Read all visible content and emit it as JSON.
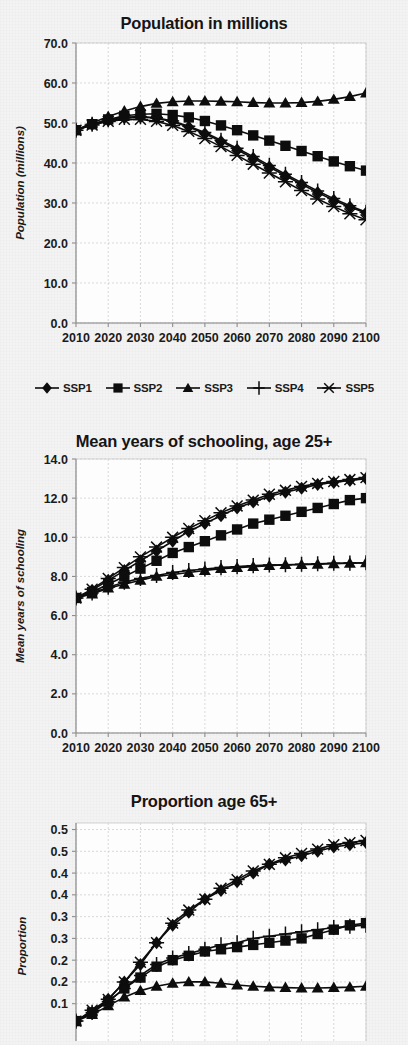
{
  "figure": {
    "background_color": "#f3f3f3",
    "ink_color": "#0d0d0d",
    "grid_color": "#cfcfcf"
  },
  "legend": {
    "items": [
      {
        "label": "SSP1",
        "marker": "diamond-marker"
      },
      {
        "label": "SSP2",
        "marker": "square-marker"
      },
      {
        "label": "SSP3",
        "marker": "triangle-marker"
      },
      {
        "label": "SSP4",
        "marker": "plus-marker"
      },
      {
        "label": "SSP5",
        "marker": "asterisk-marker"
      }
    ]
  },
  "chart_data": [
    {
      "type": "line",
      "id": "population",
      "title": "Population in millions",
      "xlabel": "",
      "ylabel": "Population (millions)",
      "x": [
        2010,
        2015,
        2020,
        2025,
        2030,
        2035,
        2040,
        2045,
        2050,
        2055,
        2060,
        2065,
        2070,
        2075,
        2080,
        2085,
        2090,
        2095,
        2100
      ],
      "xticks": [
        2010,
        2020,
        2030,
        2040,
        2050,
        2060,
        2070,
        2080,
        2090,
        2100
      ],
      "yticks": [
        "0.0",
        "10.0",
        "20.0",
        "30.0",
        "40.0",
        "50.0",
        "60.0",
        "70.0"
      ],
      "ylim": [
        0,
        70
      ],
      "xlim": [
        2010,
        2100
      ],
      "grid": true,
      "legend_position": "below",
      "series": [
        {
          "name": "SSP1",
          "marker": "diamond-marker",
          "values": [
            48.2,
            49.6,
            50.6,
            51.3,
            51.5,
            51.2,
            50.3,
            49.0,
            47.3,
            45.4,
            43.3,
            41.2,
            39.0,
            36.8,
            34.7,
            32.6,
            30.7,
            29.0,
            27.5
          ]
        },
        {
          "name": "SSP2",
          "marker": "square-marker",
          "values": [
            48.2,
            49.7,
            50.9,
            51.8,
            52.2,
            52.3,
            52.0,
            51.4,
            50.5,
            49.4,
            48.2,
            46.9,
            45.6,
            44.3,
            43.0,
            41.7,
            40.4,
            39.2,
            38.1
          ]
        },
        {
          "name": "SSP3",
          "marker": "triangle-marker",
          "values": [
            48.2,
            50.0,
            51.6,
            53.0,
            54.1,
            54.9,
            55.3,
            55.5,
            55.5,
            55.4,
            55.3,
            55.1,
            55.0,
            55.0,
            55.1,
            55.4,
            55.9,
            56.6,
            57.5
          ]
        },
        {
          "name": "SSP4",
          "marker": "plus-marker",
          "values": [
            48.2,
            49.7,
            50.8,
            51.4,
            51.6,
            51.3,
            50.5,
            49.2,
            47.6,
            45.7,
            43.7,
            41.6,
            39.4,
            37.2,
            35.1,
            33.0,
            31.1,
            29.3,
            27.7
          ]
        },
        {
          "name": "SSP5",
          "marker": "asterisk-marker",
          "values": [
            48.2,
            49.5,
            50.4,
            50.9,
            50.9,
            50.4,
            49.4,
            47.9,
            46.1,
            44.1,
            41.9,
            39.7,
            37.5,
            35.3,
            33.1,
            31.0,
            29.1,
            27.3,
            25.8
          ]
        }
      ]
    },
    {
      "type": "line",
      "id": "schooling",
      "title": "Mean years of schooling, age 25+",
      "xlabel": "",
      "ylabel": "Mean years of schooling",
      "x": [
        2010,
        2015,
        2020,
        2025,
        2030,
        2035,
        2040,
        2045,
        2050,
        2055,
        2060,
        2065,
        2070,
        2075,
        2080,
        2085,
        2090,
        2095,
        2100
      ],
      "xticks": [
        2010,
        2020,
        2030,
        2040,
        2050,
        2060,
        2070,
        2080,
        2090,
        2100
      ],
      "yticks": [
        "0.0",
        "2.0",
        "4.0",
        "6.0",
        "8.0",
        "10.0",
        "12.0",
        "14.0"
      ],
      "ylim": [
        0,
        14
      ],
      "xlim": [
        2010,
        2100
      ],
      "grid": true,
      "legend_position": "none",
      "series": [
        {
          "name": "SSP1",
          "marker": "diamond-marker",
          "values": [
            6.9,
            7.3,
            7.8,
            8.3,
            8.8,
            9.3,
            9.8,
            10.3,
            10.7,
            11.1,
            11.5,
            11.8,
            12.1,
            12.3,
            12.5,
            12.7,
            12.8,
            12.9,
            13.0
          ]
        },
        {
          "name": "SSP2",
          "marker": "square-marker",
          "values": [
            6.9,
            7.2,
            7.6,
            8.0,
            8.4,
            8.8,
            9.2,
            9.5,
            9.8,
            10.1,
            10.4,
            10.7,
            10.9,
            11.1,
            11.3,
            11.5,
            11.7,
            11.9,
            12.0
          ]
        },
        {
          "name": "SSP3",
          "marker": "triangle-marker",
          "values": [
            6.9,
            7.1,
            7.4,
            7.6,
            7.8,
            8.0,
            8.1,
            8.2,
            8.3,
            8.4,
            8.45,
            8.5,
            8.55,
            8.6,
            8.6,
            8.62,
            8.65,
            8.67,
            8.7
          ]
        },
        {
          "name": "SSP4",
          "marker": "plus-marker",
          "values": [
            6.9,
            7.15,
            7.45,
            7.7,
            7.9,
            8.05,
            8.2,
            8.3,
            8.38,
            8.45,
            8.5,
            8.55,
            8.58,
            8.6,
            8.62,
            8.65,
            8.67,
            8.68,
            8.7
          ]
        },
        {
          "name": "SSP5",
          "marker": "asterisk-marker",
          "values": [
            6.9,
            7.35,
            7.9,
            8.45,
            9.0,
            9.5,
            10.0,
            10.45,
            10.85,
            11.25,
            11.6,
            11.9,
            12.2,
            12.4,
            12.6,
            12.75,
            12.85,
            12.95,
            13.05
          ]
        }
      ]
    },
    {
      "type": "line",
      "id": "proportion",
      "title": "Proportion age 65+",
      "xlabel": "",
      "ylabel": "Proportion",
      "x": [
        2010,
        2015,
        2020,
        2025,
        2030,
        2035,
        2040,
        2045,
        2050,
        2055,
        2060,
        2065,
        2070,
        2075,
        2080,
        2085,
        2090,
        2095,
        2100
      ],
      "xticks": [
        2010,
        2020,
        2030,
        2040,
        2050,
        2060,
        2070,
        2080,
        2090,
        2100
      ],
      "yticks": [
        "0.1",
        "0.2",
        "0.2",
        "0.3",
        "0.3",
        "0.4",
        "0.4",
        "0.5",
        "0.5"
      ],
      "ytick_values": [
        0.15,
        0.2,
        0.25,
        0.3,
        0.35,
        0.4,
        0.45,
        0.5,
        0.55
      ],
      "ylim": [
        0.0,
        0.565
      ],
      "xlim": [
        2010,
        2100
      ],
      "grid": true,
      "legend_position": "none",
      "clipped_bottom": true,
      "series": [
        {
          "name": "SSP1",
          "marker": "diamond-marker",
          "values": [
            0.11,
            0.13,
            0.16,
            0.2,
            0.24,
            0.29,
            0.33,
            0.36,
            0.39,
            0.41,
            0.43,
            0.45,
            0.47,
            0.48,
            0.49,
            0.5,
            0.51,
            0.515,
            0.52
          ]
        },
        {
          "name": "SSP2",
          "marker": "square-marker",
          "values": [
            0.11,
            0.13,
            0.155,
            0.185,
            0.21,
            0.235,
            0.25,
            0.26,
            0.27,
            0.275,
            0.28,
            0.285,
            0.29,
            0.295,
            0.3,
            0.31,
            0.32,
            0.33,
            0.335
          ]
        },
        {
          "name": "SSP3",
          "marker": "triangle-marker",
          "values": [
            0.11,
            0.125,
            0.145,
            0.165,
            0.18,
            0.19,
            0.197,
            0.2,
            0.2,
            0.197,
            0.193,
            0.19,
            0.188,
            0.187,
            0.186,
            0.186,
            0.187,
            0.188,
            0.19
          ]
        },
        {
          "name": "SSP4",
          "marker": "plus-marker",
          "values": [
            0.11,
            0.13,
            0.155,
            0.185,
            0.215,
            0.24,
            0.255,
            0.265,
            0.275,
            0.285,
            0.29,
            0.3,
            0.305,
            0.31,
            0.315,
            0.32,
            0.325,
            0.328,
            0.33
          ]
        },
        {
          "name": "SSP5",
          "marker": "asterisk-marker",
          "values": [
            0.11,
            0.135,
            0.16,
            0.2,
            0.245,
            0.29,
            0.335,
            0.365,
            0.39,
            0.415,
            0.435,
            0.455,
            0.47,
            0.485,
            0.495,
            0.505,
            0.515,
            0.52,
            0.525
          ]
        }
      ]
    }
  ]
}
